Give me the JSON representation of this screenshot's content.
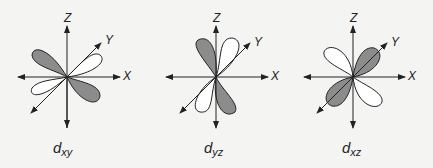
{
  "diagram": {
    "colors": {
      "background": "#f4f4f2",
      "shaded_lobe": "#8c8c8c",
      "unshaded_lobe": "#ffffff",
      "line": "#222222"
    },
    "panels": [
      {
        "orbital": "d",
        "subscript": "xy",
        "axes": {
          "z": "Z",
          "y": "Y",
          "x": "X"
        }
      },
      {
        "orbital": "d",
        "subscript": "yz",
        "axes": {
          "z": "Z",
          "y": "Y",
          "x": "X"
        }
      },
      {
        "orbital": "d",
        "subscript": "xz",
        "axes": {
          "z": "Z",
          "y": "Y",
          "x": "X"
        }
      }
    ]
  }
}
